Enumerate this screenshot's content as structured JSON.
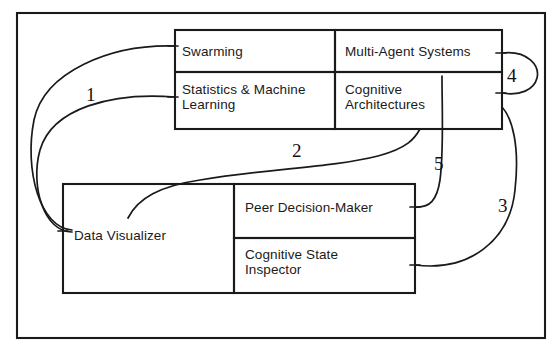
{
  "diagram": {
    "stroke_color": "#1a1a1a",
    "background_color": "#ffffff",
    "outer_frame": {
      "x": 17,
      "y": 13,
      "w": 528,
      "h": 325
    },
    "boxes": [
      {
        "id": "swarming",
        "label": "Swarming",
        "x": 175,
        "y": 30,
        "w": 160,
        "h": 42,
        "text_x": 182,
        "text_y": 44
      },
      {
        "id": "multi-agent-systems",
        "label": "Multi-Agent Systems",
        "x": 335,
        "y": 30,
        "w": 167,
        "h": 42,
        "text_x": 345,
        "text_y": 44
      },
      {
        "id": "statistics-machine-learning",
        "label": "Statistics & Machine\nLearning",
        "x": 175,
        "y": 72,
        "w": 160,
        "h": 57,
        "text_x": 182,
        "text_y": 82
      },
      {
        "id": "cognitive-architectures",
        "label": "Cognitive\nArchitectures",
        "x": 335,
        "y": 72,
        "w": 167,
        "h": 57,
        "text_x": 345,
        "text_y": 82
      },
      {
        "id": "data-visualizer",
        "label": "Data Visualizer",
        "x": 63,
        "y": 184,
        "w": 171,
        "h": 109,
        "text_x": 74,
        "text_y": 228
      },
      {
        "id": "peer-decision-maker",
        "label": "Peer Decision-Maker",
        "x": 234,
        "y": 184,
        "w": 181,
        "h": 54,
        "text_x": 245,
        "text_y": 200
      },
      {
        "id": "cognitive-state-inspector",
        "label": "Cognitive State\nInspector",
        "x": 234,
        "y": 238,
        "w": 181,
        "h": 55,
        "text_x": 245,
        "text_y": 247
      }
    ],
    "connectors": [
      {
        "id": "connector-1a",
        "number": "1",
        "from": "data-visualizer",
        "to": "swarming",
        "path": "M 72 230 C 40 228 24 170 34 120 C 44 72 110 44 175 46"
      },
      {
        "id": "connector-1b",
        "number": "1",
        "from": "data-visualizer",
        "to": "statistics-machine-learning",
        "path": "M 72 232 C 44 232 30 186 40 150 C 52 108 112 92 175 97"
      },
      {
        "id": "connector-2",
        "number": "2",
        "from": "data-visualizer",
        "to": "cognitive-architectures",
        "path": "M 128 218 C 138 198 160 186 200 180 C 270 168 330 168 378 156 C 408 148 415 138 420 129"
      },
      {
        "id": "connector-3",
        "number": "3",
        "from": "cognitive-state-inspector",
        "to": "top-right-box",
        "path": "M 415 265 C 470 272 510 240 515 190 C 520 145 512 118 502 107"
      },
      {
        "id": "connector-4",
        "number": "4",
        "from": "multi-agent-systems",
        "to": "cognitive-architectures",
        "path": "M 502 53 C 528 50 540 66 537 78 C 534 90 520 96 502 93"
      },
      {
        "id": "connector-5",
        "number": "5",
        "from": "peer-decision-maker",
        "to": "multi-agent-systems",
        "path": "M 415 207 C 430 208 437 200 440 180 C 444 150 442 110 442 76"
      }
    ],
    "connector_labels": [
      {
        "id": "label-1",
        "text": "1",
        "x": 86,
        "y": 85
      },
      {
        "id": "label-2",
        "text": "2",
        "x": 292,
        "y": 141
      },
      {
        "id": "label-3",
        "text": "3",
        "x": 498,
        "y": 196
      },
      {
        "id": "label-4",
        "text": "4",
        "x": 507,
        "y": 66
      },
      {
        "id": "label-5",
        "text": "5",
        "x": 434,
        "y": 154
      }
    ],
    "tick_marks": [
      {
        "id": "tick-swarming-in",
        "x1": 168,
        "y1": 46,
        "x2": 178,
        "y2": 46
      },
      {
        "id": "tick-statistics-in",
        "x1": 168,
        "y1": 97,
        "x2": 178,
        "y2": 97
      },
      {
        "id": "tick-data-visualizer-in",
        "x1": 58,
        "y1": 231,
        "x2": 68,
        "y2": 231
      },
      {
        "id": "tick-mas-out",
        "x1": 496,
        "y1": 53,
        "x2": 506,
        "y2": 53
      },
      {
        "id": "tick-cogarch-in",
        "x1": 496,
        "y1": 93,
        "x2": 506,
        "y2": 93
      },
      {
        "id": "tick-pdm-out",
        "x1": 410,
        "y1": 207,
        "x2": 420,
        "y2": 207
      },
      {
        "id": "tick-csi-out",
        "x1": 410,
        "y1": 265,
        "x2": 420,
        "y2": 265
      }
    ]
  }
}
